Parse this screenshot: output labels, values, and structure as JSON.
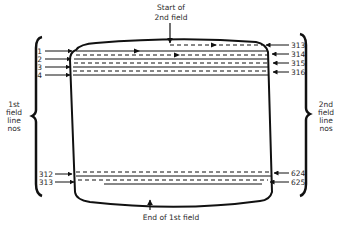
{
  "title_top": {
    "line1": "Start of",
    "line2": "2nd field"
  },
  "title_bottom": "End of 1st field",
  "left_brace_label": [
    "1st",
    "field",
    "line",
    "nos"
  ],
  "right_brace_label": [
    "2nd",
    "field",
    "line",
    "nos"
  ],
  "left_line_numbers": [
    "1",
    "2",
    "3",
    "4",
    "312",
    "313"
  ],
  "right_line_numbers": [
    "313",
    "314",
    "315",
    "316",
    "624",
    "625"
  ],
  "colors": {
    "ink": "#111111",
    "text": "#2a2a2a",
    "background": "#ffffff"
  }
}
